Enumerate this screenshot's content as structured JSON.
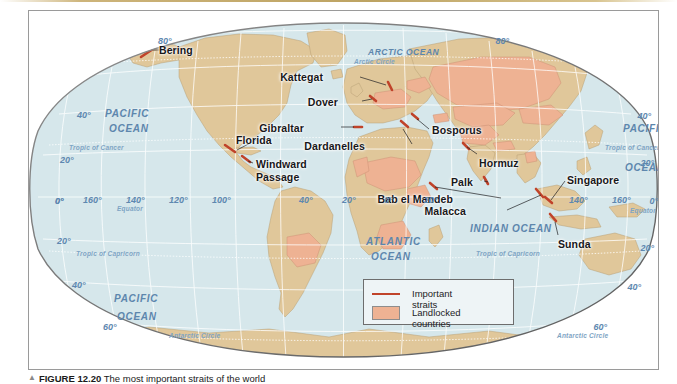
{
  "figure": {
    "caption_marker": "▲",
    "caption_number": "FIGURE 12.20",
    "caption_text": "The most important straits of the world"
  },
  "legend": {
    "items": [
      {
        "label": "Important straits",
        "swatch": "line",
        "color": "#c0432a"
      },
      {
        "label": "Landlocked countries",
        "swatch": "box",
        "color": "#eeb293"
      }
    ]
  },
  "colors": {
    "ocean": "#d6e7ec",
    "land": "#e0c79a",
    "landlocked": "#eeb293",
    "strait": "#c0432a",
    "graticule": "#ffffff",
    "label_blue": "#5d86ad",
    "label_black": "#17171a",
    "page_rule": "#bda362"
  },
  "straits": [
    {
      "name": "Bering",
      "x": 130,
      "y": 34
    },
    {
      "name": "Kattegat",
      "x": 294,
      "y": 61
    },
    {
      "name": "Dover",
      "x": 309,
      "y": 86
    },
    {
      "name": "Gibraltar",
      "x": 275,
      "y": 112
    },
    {
      "name": "Dardanelles",
      "x": 336,
      "y": 130
    },
    {
      "name": "Bosporus",
      "x": 403,
      "y": 114
    },
    {
      "name": "Florida",
      "x": 207,
      "y": 124
    },
    {
      "name": "Windward Passage",
      "x": 227,
      "y": 148
    },
    {
      "name": "Hormuz",
      "x": 450,
      "y": 147
    },
    {
      "name": "Palk",
      "x": 444,
      "y": 166
    },
    {
      "name": "Singapore",
      "x": 538,
      "y": 164
    },
    {
      "name": "Bab el Mandeb",
      "x": 424,
      "y": 183
    },
    {
      "name": "Malacca",
      "x": 437,
      "y": 195
    },
    {
      "name": "Sunda",
      "x": 529,
      "y": 228
    }
  ],
  "oceans": [
    {
      "name": "PACIFIC",
      "x": 76,
      "y": 98,
      "size": "lg"
    },
    {
      "name": "OCEAN",
      "x": 80,
      "y": 113,
      "size": "lg"
    },
    {
      "name": "PACIFIC",
      "x": 594,
      "y": 113,
      "size": "lg"
    },
    {
      "name": "OCEAN",
      "x": 596,
      "y": 152,
      "size": "lg"
    },
    {
      "name": "ATLANTIC",
      "x": 337,
      "y": 226,
      "size": "lg"
    },
    {
      "name": "OCEAN",
      "x": 342,
      "y": 241,
      "size": "lg"
    },
    {
      "name": "PACIFIC",
      "x": 85,
      "y": 283,
      "size": "lg"
    },
    {
      "name": "OCEAN",
      "x": 88,
      "y": 301,
      "size": "lg"
    },
    {
      "name": "INDIAN  OCEAN",
      "x": 441,
      "y": 213,
      "size": "lg"
    },
    {
      "name": "ARCTIC OCEAN",
      "x": 339,
      "y": 37,
      "size": "sm"
    }
  ],
  "reference_lines": [
    {
      "label": "Arctic Circle",
      "x": 325,
      "y": 48
    },
    {
      "label": "Tropic of Cancer",
      "x": 40,
      "y": 134
    },
    {
      "label": "Tropic of Cancer",
      "x": 576,
      "y": 134
    },
    {
      "label": "Equator",
      "x": 88,
      "y": 195
    },
    {
      "label": "Equator",
      "x": 601,
      "y": 197
    },
    {
      "label": "Tropic of Capricorn",
      "x": 47,
      "y": 240
    },
    {
      "label": "Tropic of Capricorn",
      "x": 447,
      "y": 240
    },
    {
      "label": "Antarctic Circle",
      "x": 140,
      "y": 322
    },
    {
      "label": "Antarctic Circle",
      "x": 528,
      "y": 322
    }
  ],
  "graticule_labels": {
    "left": [
      {
        "text": "80°",
        "x": 129,
        "y": 26
      },
      {
        "text": "40°",
        "x": 48,
        "y": 100
      },
      {
        "text": "20°",
        "x": 31,
        "y": 145
      },
      {
        "text": "0°",
        "x": 26,
        "y": 186
      },
      {
        "text": "20°",
        "x": 28,
        "y": 226
      },
      {
        "text": "40°",
        "x": 43,
        "y": 270
      },
      {
        "text": "60°",
        "x": 74,
        "y": 312
      }
    ],
    "right": [
      {
        "text": "80°",
        "x": 480,
        "y": 26
      },
      {
        "text": "40°",
        "x": 622,
        "y": 101
      },
      {
        "text": "20°",
        "x": 625,
        "y": 148
      },
      {
        "text": "0°",
        "x": 629,
        "y": 186
      },
      {
        "text": "20°",
        "x": 625,
        "y": 233
      },
      {
        "text": "40°",
        "x": 612,
        "y": 272
      },
      {
        "text": "60°",
        "x": 578,
        "y": 312
      }
    ],
    "equator": [
      {
        "text": "0°",
        "x": 26,
        "y": 186
      },
      {
        "text": "160°",
        "x": 54,
        "y": 185
      },
      {
        "text": "140°",
        "x": 97,
        "y": 185
      },
      {
        "text": "120°",
        "x": 140,
        "y": 185
      },
      {
        "text": "100°",
        "x": 183,
        "y": 185
      },
      {
        "text": "40°",
        "x": 270,
        "y": 185
      },
      {
        "text": "20°",
        "x": 313,
        "y": 185
      },
      {
        "text": "0°",
        "x": 355,
        "y": 185
      },
      {
        "text": "20°",
        "x": 395,
        "y": 185
      },
      {
        "text": "140°",
        "x": 540,
        "y": 185
      },
      {
        "text": "160°",
        "x": 583,
        "y": 185
      }
    ]
  }
}
